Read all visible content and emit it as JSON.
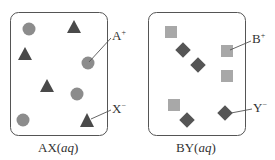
{
  "colors": {
    "border": "#555555",
    "circle": "#8c8c8c",
    "triangle": "#4a4a4a",
    "square": "#a8a8a8",
    "diamond": "#555555",
    "text": "#333333"
  },
  "panels": [
    {
      "id": "AX",
      "caption_main": "AX(",
      "caption_state": "aq",
      "caption_close": ")",
      "labels": [
        {
          "text": "A",
          "charge": "+",
          "points_to": "circle"
        },
        {
          "text": "X",
          "charge": "−",
          "points_to": "triangle"
        }
      ],
      "cation_shape": "circle",
      "anion_shape": "triangle",
      "cation_count": 4,
      "anion_count": 4
    },
    {
      "id": "BY",
      "caption_main": "BY(",
      "caption_state": "aq",
      "caption_close": ")",
      "labels": [
        {
          "text": "B",
          "charge": "+",
          "points_to": "square"
        },
        {
          "text": "Y",
          "charge": "−",
          "points_to": "diamond"
        }
      ],
      "cation_shape": "square",
      "anion_shape": "diamond",
      "cation_count": 4,
      "anion_count": 4
    }
  ]
}
